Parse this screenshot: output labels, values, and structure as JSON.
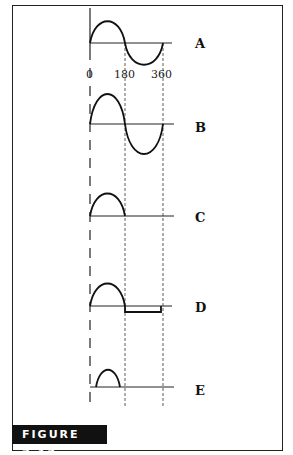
{
  "figure": {
    "caption": "FIGURE 7.12",
    "axis_ticks": [
      "0",
      "180",
      "360"
    ],
    "waveforms": [
      {
        "id": "A",
        "label": "A",
        "description": "full sine wave 0-360"
      },
      {
        "id": "B",
        "label": "B",
        "description": "full sine wave, larger amplitude"
      },
      {
        "id": "C",
        "label": "C",
        "description": "positive half-cycle only (half-wave rectified)"
      },
      {
        "id": "D",
        "label": "D",
        "description": "positive half-cycle, then small constant negative level 180-360"
      },
      {
        "id": "E",
        "label": "E",
        "description": "reduced-width positive pulse within first half-cycle"
      }
    ]
  },
  "colors": {
    "ink": "#111111",
    "background": "#ffffff",
    "caption_bg": "#111111",
    "caption_text": "#ffffff"
  }
}
